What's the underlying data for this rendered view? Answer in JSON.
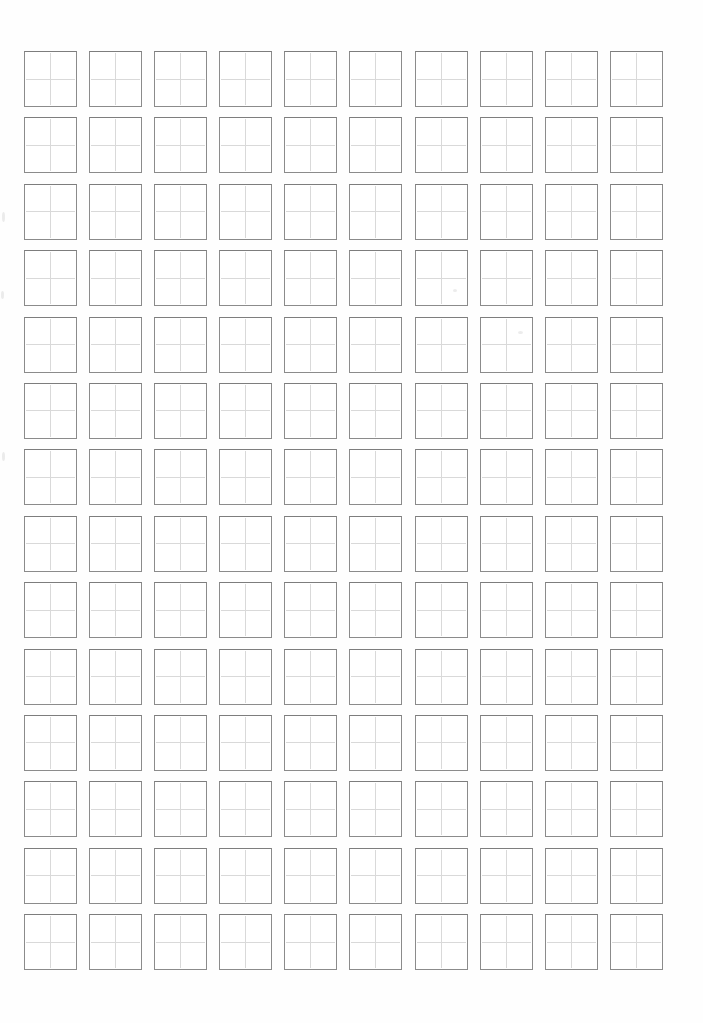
{
  "page": {
    "type": "blank-handwriting-practice-grid-sheet",
    "background_color": "#fefefe",
    "visible_text": ""
  },
  "grid": {
    "rows": 14,
    "columns": 10,
    "total_cells": 140,
    "cell_width_px": 53,
    "cell_height_px": 56,
    "column_gap_px": 12.1,
    "row_gap_px": 10.4,
    "origin_left_px": 24,
    "origin_top_px": 51,
    "cell_border_color": "#8b8b8b",
    "cell_border_top_color": "#7d7d7d",
    "guide_line_color": "#d9d9d9",
    "cell_fill_color": "#ffffff"
  },
  "artifacts": [
    {
      "x": 453,
      "y": 289,
      "w": 4,
      "h": 3
    },
    {
      "x": 518,
      "y": 331,
      "w": 5,
      "h": 3
    },
    {
      "x": 2,
      "y": 212,
      "w": 3,
      "h": 10
    },
    {
      "x": 1,
      "y": 291,
      "w": 3,
      "h": 8
    },
    {
      "x": 2,
      "y": 452,
      "w": 3,
      "h": 9
    }
  ]
}
